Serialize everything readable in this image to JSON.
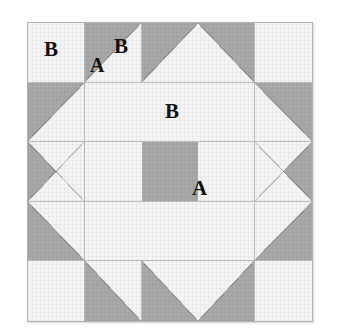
{
  "figure": {
    "kind": "quilt-block-diagram",
    "grid_columns": 5,
    "grid_rows": 5,
    "background_color": "#ffffff",
    "fabric_light_color": "#f4f4f4",
    "fabric_dark_color": "#a8a8a8",
    "seam_line_color": "#bdbdbd",
    "label_color": "#111111"
  },
  "labels": {
    "b_corner": "B",
    "a_triangle": "A",
    "b_triangle": "B",
    "b_bar": "B",
    "a_center": "A"
  },
  "patches": {
    "row1": [
      {
        "name": "corner-square-top-left",
        "type": "plain-light"
      },
      {
        "name": "flying-geese-1",
        "type": "half-square-triangle",
        "dark_corner": "tl"
      },
      {
        "name": "flying-geese-2",
        "type": "half-square-triangle",
        "dark_corner": "tl"
      },
      {
        "name": "flying-geese-3",
        "type": "half-square-triangle",
        "dark_corner": "tr"
      },
      {
        "name": "corner-square-top-right",
        "type": "plain-light"
      }
    ],
    "row2": [
      {
        "name": "side-triangle-left-top",
        "type": "half-square-triangle",
        "dark_corner": "tl"
      },
      {
        "name": "sash-bar-top-left",
        "type": "plain-light"
      },
      {
        "name": "sash-bar-top-center",
        "type": "plain-light"
      },
      {
        "name": "sash-bar-top-right",
        "type": "plain-light"
      },
      {
        "name": "side-triangle-right-top",
        "type": "half-square-triangle",
        "dark_corner": "tr"
      }
    ],
    "row3": [
      {
        "name": "side-triangle-left-mid",
        "type": "half-square-triangle",
        "dark_corner": "split-left"
      },
      {
        "name": "sash-bar-left",
        "type": "plain-light"
      },
      {
        "name": "center-square",
        "type": "plain-dark"
      },
      {
        "name": "sash-bar-right",
        "type": "plain-light"
      },
      {
        "name": "side-triangle-right-mid",
        "type": "half-square-triangle",
        "dark_corner": "split-right"
      }
    ],
    "row4": [
      {
        "name": "side-triangle-left-bottom",
        "type": "half-square-triangle",
        "dark_corner": "bl"
      },
      {
        "name": "sash-bar-bottom-left",
        "type": "plain-light"
      },
      {
        "name": "sash-bar-bottom-center",
        "type": "plain-light"
      },
      {
        "name": "sash-bar-bottom-right",
        "type": "plain-light"
      },
      {
        "name": "side-triangle-right-bottom",
        "type": "half-square-triangle",
        "dark_corner": "br"
      }
    ],
    "row5": [
      {
        "name": "corner-square-bottom-left",
        "type": "plain-light"
      },
      {
        "name": "flying-geese-4",
        "type": "half-square-triangle",
        "dark_corner": "bl"
      },
      {
        "name": "flying-geese-5",
        "type": "half-square-triangle",
        "dark_corner": "bl"
      },
      {
        "name": "flying-geese-6",
        "type": "half-square-triangle",
        "dark_corner": "br"
      },
      {
        "name": "corner-square-bottom-right",
        "type": "plain-light"
      }
    ]
  }
}
